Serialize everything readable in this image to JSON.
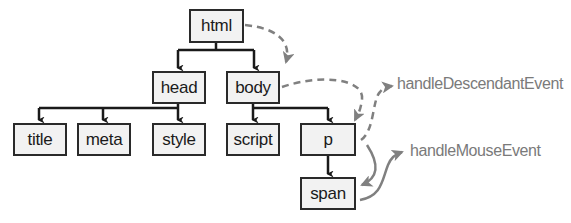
{
  "diagram": {
    "type": "dom-tree-event-handlers",
    "colors": {
      "node_border": "#2a2a2a",
      "node_fill": "#f2f2f2",
      "tree_edge": "#1a1a1a",
      "event_arrow": "#808080",
      "label_text": "#7a7a7a"
    },
    "nodes": {
      "html": "html",
      "head": "head",
      "body": "body",
      "title": "title",
      "meta": "meta",
      "style": "style",
      "script": "script",
      "p": "p",
      "span": "span"
    },
    "edges": [
      [
        "html",
        "head"
      ],
      [
        "html",
        "body"
      ],
      [
        "head",
        "title"
      ],
      [
        "head",
        "meta"
      ],
      [
        "head",
        "style"
      ],
      [
        "body",
        "script"
      ],
      [
        "body",
        "p"
      ],
      [
        "p",
        "span"
      ]
    ],
    "event_flow": [
      {
        "from": "html",
        "to": "body",
        "style": "dashed"
      },
      {
        "from": "body",
        "to": "p",
        "style": "dashed"
      },
      {
        "from": "p",
        "to": "handleDescendantEvent",
        "style": "dashed"
      },
      {
        "from": "p",
        "to": "span",
        "style": "solid"
      },
      {
        "from": "span",
        "to": "handleMouseEvent",
        "style": "solid"
      }
    ],
    "handlers": {
      "descendant": "handleDescendantEvent",
      "mouse": "handleMouseEvent"
    }
  }
}
